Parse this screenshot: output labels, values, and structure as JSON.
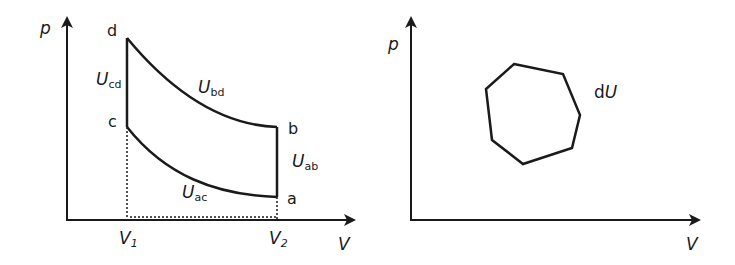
{
  "left_diagram": {
    "y_axis_label": "p",
    "x_axis_label": "V",
    "points": {
      "a": "a",
      "b": "b",
      "c": "c",
      "d": "d"
    },
    "ticks": {
      "v1": "V",
      "v1_sub": "1",
      "v2": "V",
      "v2_sub": "2"
    },
    "labels": {
      "ucd": {
        "main": "U",
        "sub": "cd"
      },
      "ubd": {
        "main": "U",
        "sub": "bd"
      },
      "uab": {
        "main": "U",
        "sub": "ab"
      },
      "uac": {
        "main": "U",
        "sub": "ac"
      }
    }
  },
  "right_diagram": {
    "y_axis_label": "p",
    "x_axis_label": "V",
    "cycle_label": {
      "prefix": "d",
      "main": "U"
    }
  },
  "colors": {
    "stroke": "#1a1a1a",
    "background": "#ffffff"
  }
}
